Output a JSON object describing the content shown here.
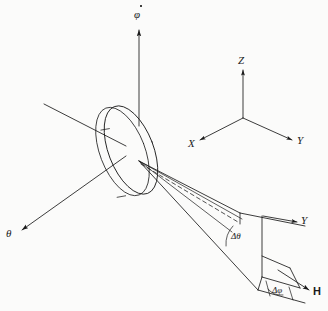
{
  "figure": {
    "kind": "line-diagram",
    "background_color": "#fbfbfa",
    "stroke_color": "#1a1a1a",
    "width": 328,
    "height": 311
  },
  "labels": {
    "phi_dot": "φ",
    "phi_dot_name": "phi-dot",
    "theta": "θ",
    "triad_z": "Z",
    "triad_x": "X",
    "triad_y": "Y",
    "patch_y": "Y",
    "delta_theta": "Δθ",
    "delta_phi": "Δφ",
    "field_h": "H"
  },
  "elements": {
    "disk": "rotating-disk",
    "spin_axis": "phi-dot-spin-axis",
    "theta_axis": "theta-axis-arrow",
    "tilt_line": "disk-normal-line",
    "cone": "solid-angle-cone",
    "cone_center_line": "cone-center-dashed-line",
    "triad": "xyz-coordinate-triad",
    "patch": "solid-angle-patch",
    "h_vector": "magnetic-field-vector"
  },
  "geometry": {
    "disk_center_x": 128,
    "disk_center_y": 150,
    "disk_rx": 22,
    "disk_ry": 46,
    "disk_rotation_deg": -22,
    "cone_apex_x": 139,
    "cone_apex_y": 161,
    "triad_origin_x": 243,
    "triad_origin_y": 118
  }
}
